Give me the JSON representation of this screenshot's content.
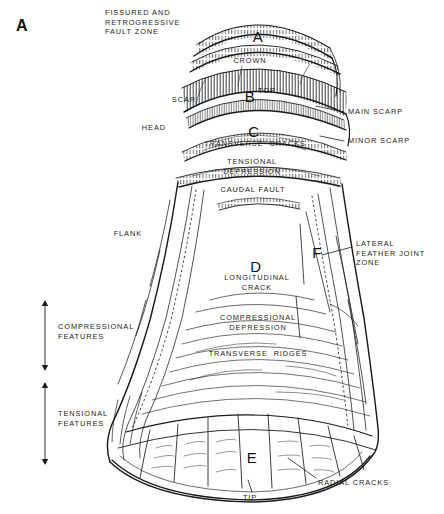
{
  "figure": {
    "panel_label": "A",
    "domain": "geological-diagram",
    "title_text": "",
    "stroke_color": "#1a1a1a",
    "background_color": "#ffffff",
    "width": 444,
    "height": 514
  },
  "zone_letters": [
    {
      "letter": "A",
      "x": 258,
      "y": 38,
      "note": "crown zone"
    },
    {
      "letter": "B",
      "x": 250,
      "y": 98,
      "note": "main scarp / top"
    },
    {
      "letter": "C",
      "x": 254,
      "y": 133,
      "note": "transverse cracks zone"
    },
    {
      "letter": "D",
      "x": 256,
      "y": 268,
      "note": "longitudinal crack zone"
    },
    {
      "letter": "E",
      "x": 252,
      "y": 459,
      "note": "toe zone"
    },
    {
      "letter": "F",
      "x": 317,
      "y": 254,
      "note": "lateral feather joint zone"
    }
  ],
  "zone_superscript": {
    "text": "TOP",
    "x": 258,
    "y": 90
  },
  "labels_left": [
    {
      "text": "SCAR",
      "x": 196,
      "y": 95,
      "align": "right"
    },
    {
      "text": "HEAD",
      "x": 166,
      "y": 123,
      "align": "right"
    },
    {
      "text": "FLANK",
      "x": 142,
      "y": 229,
      "align": "right"
    }
  ],
  "labels_right": [
    {
      "text": "MAIN SCARP",
      "x": 348,
      "y": 111
    },
    {
      "text": "MINOR SCARP",
      "x": 348,
      "y": 140
    },
    {
      "text": "LATERAL\nFEATHER JOINT\nZONE",
      "x": 356,
      "y": 243
    }
  ],
  "labels_center": [
    {
      "text": "FISSURED AND\nRETROGRESSIVE\nFAULT ZONE",
      "x": 105,
      "y": 8,
      "align": "left"
    },
    {
      "text": "CROWN",
      "x": 250,
      "y": 58,
      "align": "center"
    },
    {
      "text": "TRANSVERSE  CRACKS",
      "x": 255,
      "y": 143,
      "align": "center"
    },
    {
      "text": "TENSIONAL\nDEPRESSION",
      "x": 252,
      "y": 162,
      "align": "center"
    },
    {
      "text": "CAUDAL FAULT",
      "x": 253,
      "y": 188,
      "align": "center"
    },
    {
      "text": "LONGITUDINAL\nCRACK",
      "x": 257,
      "y": 278,
      "align": "center"
    },
    {
      "text": "COMPRESSIONAL\nDEPRESSION",
      "x": 258,
      "y": 318,
      "align": "center"
    },
    {
      "text": "TRANSVERSE  RIDGES",
      "x": 258,
      "y": 353,
      "align": "center"
    },
    {
      "text": "RADIAL CRACKS",
      "x": 318,
      "y": 482,
      "align": "left"
    },
    {
      "text": "TIP",
      "x": 250,
      "y": 497,
      "align": "center"
    }
  ],
  "bracket_labels": [
    {
      "text": "COMPRESSIONAL\nFEATURES",
      "x": 22,
      "y": 330
    },
    {
      "text": "TENSIONAL\nFEATURES",
      "x": 22,
      "y": 417
    }
  ],
  "arrows": [
    {
      "name": "compressional-features-arrow",
      "x": 45,
      "y_top": 301,
      "y_bottom": 370
    },
    {
      "name": "tensional-features-arrow",
      "x": 45,
      "y_top": 382,
      "y_bottom": 466
    }
  ],
  "leaders": [
    {
      "name": "main-scarp-leader",
      "x1": 344,
      "y1": 112,
      "x2": 318,
      "y2": 106
    },
    {
      "name": "minor-scarp-leader",
      "x1": 344,
      "y1": 141,
      "x2": 320,
      "y2": 136
    },
    {
      "name": "feather-joint-leader",
      "x1": 352,
      "y1": 247,
      "x2": 322,
      "y2": 255
    },
    {
      "name": "radial-cracks-leader",
      "x1": 316,
      "y1": 478,
      "x2": 288,
      "y2": 458
    },
    {
      "name": "tip-leader",
      "x1": 252,
      "y1": 492,
      "x2": 248,
      "y2": 480
    }
  ]
}
